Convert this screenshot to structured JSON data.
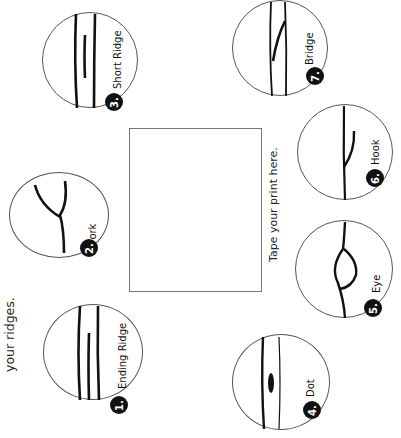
{
  "page": {
    "side_text": "your ridges.",
    "instruction": "Tape your print here."
  },
  "ridge_types": [
    {
      "number": "1.",
      "label": "Ending Ridge"
    },
    {
      "number": "2.",
      "label": "Fork"
    },
    {
      "number": "3.",
      "label": "Short Ridge"
    },
    {
      "number": "4.",
      "label": "Dot"
    },
    {
      "number": "5.",
      "label": "Eye"
    },
    {
      "number": "6.",
      "label": "Hook"
    },
    {
      "number": "7.",
      "label": "Bridge"
    }
  ],
  "colors": {
    "ink": "#111111",
    "outline": "#555555",
    "background": "#ffffff"
  }
}
